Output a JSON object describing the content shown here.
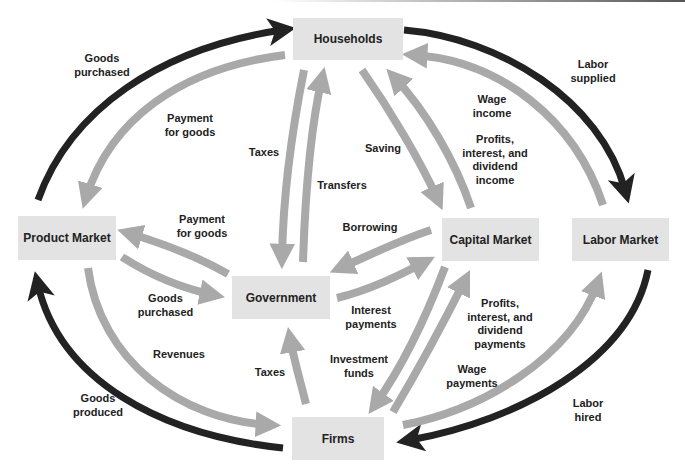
{
  "diagram": {
    "colors": {
      "dark_arrow": "#222222",
      "light_arrow": "#a9a9a9",
      "node_fill": "#e3e3e3"
    },
    "nodes": {
      "households": "Households",
      "product_market": "Product Market",
      "government": "Government",
      "capital_market": "Capital Market",
      "labor_market": "Labor Market",
      "firms": "Firms"
    },
    "labels": {
      "goods_purchased_hh": "Goods\npurchased",
      "payment_for_goods_hh": "Payment\nfor goods",
      "taxes_hh": "Taxes",
      "transfers": "Transfers",
      "saving": "Saving",
      "profits_income": "Profits,\ninterest, and\ndividend\nincome",
      "wage_income": "Wage\nincome",
      "labor_supplied": "Labor\nsupplied",
      "payment_for_goods_gov": "Payment\nfor goods",
      "goods_purchased_gov": "Goods\npurchased",
      "borrowing": "Borrowing",
      "interest_payments": "Interest\npayments",
      "revenues": "Revenues",
      "goods_produced": "Goods\nproduced",
      "taxes_firms": "Taxes",
      "investment_funds": "Investment\nfunds",
      "profits_payments": "Profits,\ninterest, and\ndividend\npayments",
      "wage_payments": "Wage\npayments",
      "labor_hired": "Labor\nhired"
    },
    "flows": [
      {
        "from": "Product Market",
        "to": "Households",
        "label": "Goods purchased",
        "style": "dark"
      },
      {
        "from": "Households",
        "to": "Product Market",
        "label": "Payment for goods",
        "style": "light"
      },
      {
        "from": "Households",
        "to": "Government",
        "label": "Taxes",
        "style": "light"
      },
      {
        "from": "Government",
        "to": "Households",
        "label": "Transfers",
        "style": "light"
      },
      {
        "from": "Households",
        "to": "Capital Market",
        "label": "Saving",
        "style": "light"
      },
      {
        "from": "Capital Market",
        "to": "Households",
        "label": "Profits, interest, and dividend income",
        "style": "light"
      },
      {
        "from": "Labor Market",
        "to": "Households",
        "label": "Wage income",
        "style": "light"
      },
      {
        "from": "Households",
        "to": "Labor Market",
        "label": "Labor supplied",
        "style": "dark"
      },
      {
        "from": "Government",
        "to": "Product Market",
        "label": "Payment for goods",
        "style": "light"
      },
      {
        "from": "Product Market",
        "to": "Government",
        "label": "Goods purchased",
        "style": "light"
      },
      {
        "from": "Capital Market",
        "to": "Government",
        "label": "Borrowing",
        "style": "light"
      },
      {
        "from": "Government",
        "to": "Capital Market",
        "label": "Interest payments",
        "style": "light"
      },
      {
        "from": "Product Market",
        "to": "Firms",
        "label": "Revenues",
        "style": "light"
      },
      {
        "from": "Firms",
        "to": "Product Market",
        "label": "Goods produced",
        "style": "dark"
      },
      {
        "from": "Firms",
        "to": "Government",
        "label": "Taxes",
        "style": "light"
      },
      {
        "from": "Capital Market",
        "to": "Firms",
        "label": "Investment funds",
        "style": "light"
      },
      {
        "from": "Firms",
        "to": "Capital Market",
        "label": "Profits, interest, and dividend payments",
        "style": "light"
      },
      {
        "from": "Firms",
        "to": "Labor Market",
        "label": "Wage payments",
        "style": "light"
      },
      {
        "from": "Labor Market",
        "to": "Firms",
        "label": "Labor hired",
        "style": "dark"
      }
    ]
  }
}
